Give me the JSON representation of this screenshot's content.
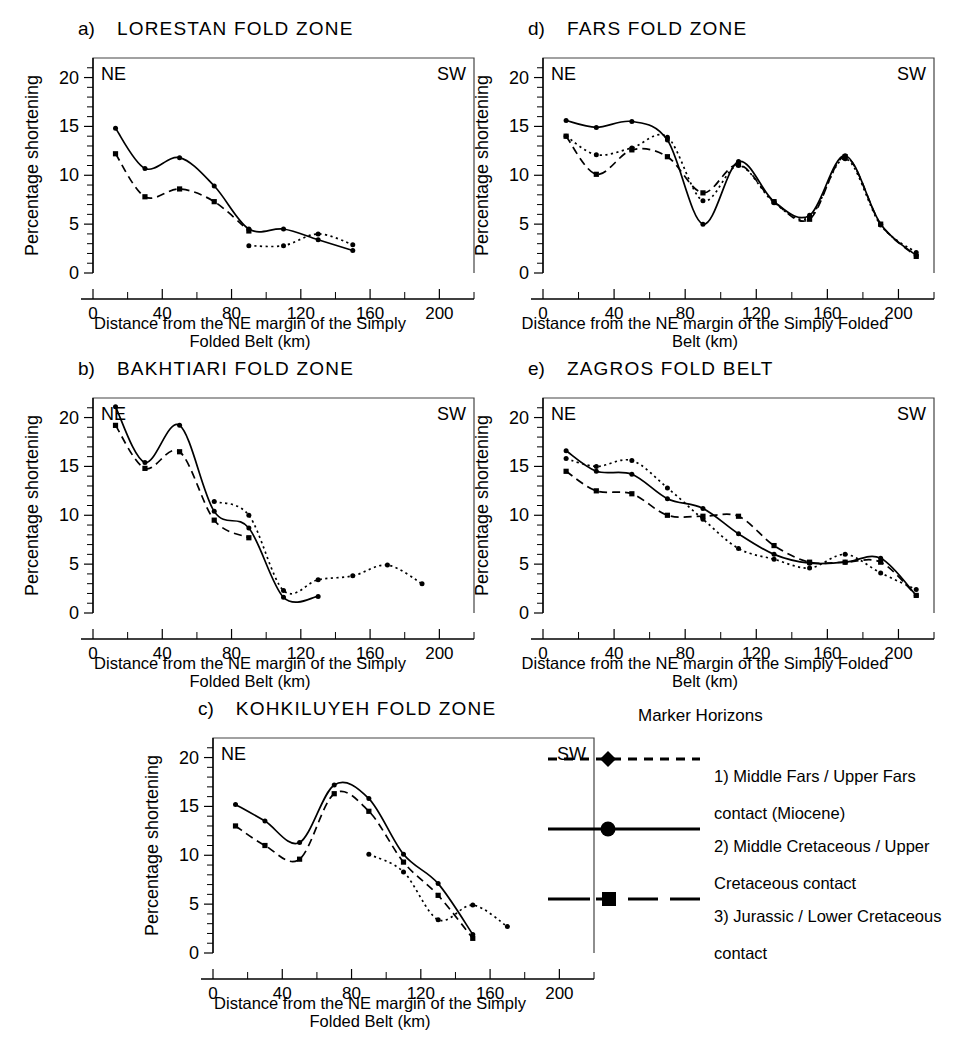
{
  "figure": {
    "axis_y_label": "Percentage shortening",
    "axis_x_label": "Distance from the NE margin of the Simply Folded Belt (km)",
    "axis_x_label_line1": "Distance from the NE margin of the Simply",
    "axis_x_label_line2": "Folded Belt (km)",
    "axis_x_label_wide_line1": "Distance from the NE margin of the Simply Folded",
    "axis_x_label_wide_line2": "Belt (km)",
    "corner_left": "NE",
    "corner_right": "SW",
    "yticks": [
      "0",
      "5",
      "10",
      "15",
      "20"
    ],
    "xticks": [
      "0",
      "40",
      "80",
      "120",
      "160",
      "200"
    ]
  },
  "legend": {
    "title": "Marker Horizons",
    "items": [
      {
        "style": "dotted-diamond",
        "line1": "1) Middle Fars / Upper Fars",
        "line2": "contact (Miocene)"
      },
      {
        "style": "solid-circle",
        "line1": "2) Middle Cretaceous / Upper",
        "line2": "Cretaceous contact"
      },
      {
        "style": "dashed-square",
        "line1": "3) Jurassic / Lower Cretaceous",
        "line2": "contact"
      }
    ]
  },
  "chart_data": [
    {
      "id": "a",
      "type": "line",
      "letter": "a)",
      "title": "LORESTAN  FOLD  ZONE",
      "xlabel": "Distance from the NE margin of the Simply Folded Belt (km)",
      "ylabel": "Percentage shortening",
      "xlim": [
        0,
        220
      ],
      "ylim": [
        0,
        22
      ],
      "grid": false,
      "series": [
        {
          "name": "1) Middle Fars / Upper Fars contact (Miocene)",
          "style": "dotted",
          "x": [
            90,
            110,
            130,
            150
          ],
          "y": [
            2.8,
            2.8,
            4.0,
            2.9
          ]
        },
        {
          "name": "2) Middle Cretaceous / Upper Cretaceous contact",
          "style": "solid",
          "x": [
            13,
            30,
            50,
            70,
            90,
            110,
            130,
            150
          ],
          "y": [
            14.8,
            10.7,
            11.8,
            8.9,
            4.5,
            4.5,
            3.4,
            2.3
          ]
        },
        {
          "name": "3) Jurassic / Lower Cretaceous contact",
          "style": "dashed",
          "x": [
            13,
            30,
            50,
            70,
            90
          ],
          "y": [
            12.2,
            7.8,
            8.6,
            7.3,
            4.3
          ]
        }
      ]
    },
    {
      "id": "b",
      "type": "line",
      "letter": "b)",
      "title": "BAKHTIARI  FOLD  ZONE",
      "xlabel": "Distance from the NE margin of the Simply Folded Belt (km)",
      "ylabel": "Percentage shortening",
      "xlim": [
        0,
        220
      ],
      "ylim": [
        0,
        22
      ],
      "grid": false,
      "series": [
        {
          "name": "1) Middle Fars / Upper Fars contact (Miocene)",
          "style": "dotted",
          "x": [
            70,
            90,
            110,
            130,
            150,
            170,
            190
          ],
          "y": [
            11.4,
            10.0,
            2.3,
            3.4,
            3.8,
            4.9,
            3.0
          ]
        },
        {
          "name": "2) Middle Cretaceous / Upper Cretaceous contact",
          "style": "solid",
          "x": [
            13,
            30,
            50,
            70,
            90,
            110,
            130
          ],
          "y": [
            21.1,
            15.4,
            19.2,
            10.4,
            8.7,
            1.6,
            1.7
          ]
        },
        {
          "name": "3) Jurassic / Lower Cretaceous contact",
          "style": "dashed",
          "x": [
            13,
            30,
            50,
            70,
            90
          ],
          "y": [
            19.2,
            14.8,
            16.5,
            9.5,
            7.7
          ]
        }
      ]
    },
    {
      "id": "c",
      "type": "line",
      "letter": "c)",
      "title": "KOHKILUYEH  FOLD  ZONE",
      "xlabel": "Distance from the NE margin of the Simply Folded Belt (km)",
      "ylabel": "Percentage shortening",
      "xlim": [
        0,
        220
      ],
      "ylim": [
        0,
        22
      ],
      "grid": false,
      "series": [
        {
          "name": "1) Middle Fars / Upper Fars contact (Miocene)",
          "style": "dotted",
          "x": [
            90,
            110,
            130,
            150,
            170
          ],
          "y": [
            10.1,
            8.3,
            3.4,
            4.9,
            2.7
          ]
        },
        {
          "name": "2) Middle Cretaceous / Upper Cretaceous contact",
          "style": "solid",
          "x": [
            13,
            30,
            50,
            70,
            90,
            110,
            130,
            150
          ],
          "y": [
            15.2,
            13.5,
            11.3,
            17.2,
            15.8,
            10.1,
            7.1,
            1.9
          ]
        },
        {
          "name": "3) Jurassic / Lower Cretaceous contact",
          "style": "dashed",
          "x": [
            13,
            30,
            50,
            70,
            90,
            110,
            130,
            150
          ],
          "y": [
            13.0,
            11.0,
            9.6,
            16.3,
            14.5,
            9.3,
            5.9,
            1.5
          ]
        }
      ]
    },
    {
      "id": "d",
      "type": "line",
      "letter": "d)",
      "title": "FARS  FOLD  ZONE",
      "xlabel": "Distance from the NE margin of the Simply Folded Belt (km)",
      "ylabel": "Percentage shortening",
      "xlim": [
        0,
        220
      ],
      "ylim": [
        0,
        22
      ],
      "grid": false,
      "series": [
        {
          "name": "1) Middle Fars / Upper Fars contact (Miocene)",
          "style": "dotted",
          "x": [
            13,
            30,
            50,
            70,
            90,
            110,
            130,
            150,
            170,
            190,
            210
          ],
          "y": [
            14.0,
            12.1,
            12.8,
            13.9,
            7.4,
            11.0,
            7.2,
            5.7,
            11.7,
            4.9,
            2.1
          ]
        },
        {
          "name": "2) Middle Cretaceous / Upper Cretaceous contact",
          "style": "solid",
          "x": [
            13,
            30,
            50,
            70,
            90,
            110,
            130,
            150,
            170,
            190,
            210
          ],
          "y": [
            15.6,
            14.9,
            15.5,
            13.6,
            5.0,
            11.4,
            7.3,
            5.9,
            12.0,
            5.0,
            1.8
          ]
        },
        {
          "name": "3) Jurassic / Lower Cretaceous contact",
          "style": "dashed",
          "x": [
            13,
            30,
            50,
            70,
            90,
            110,
            130,
            150,
            170,
            190,
            210
          ],
          "y": [
            14.0,
            10.1,
            12.6,
            11.9,
            8.2,
            11.1,
            7.3,
            5.5,
            11.9,
            5.0,
            1.7
          ]
        }
      ]
    },
    {
      "id": "e",
      "type": "line",
      "letter": "e)",
      "title": "ZAGROS FOLD BELT",
      "xlabel": "Distance from the NE margin of the Simply Folded Belt (km)",
      "ylabel": "Percentage shortening",
      "xlim": [
        0,
        220
      ],
      "ylim": [
        0,
        22
      ],
      "grid": false,
      "series": [
        {
          "name": "1) Middle Fars / Upper Fars contact (Miocene)",
          "style": "dotted",
          "x": [
            13,
            30,
            50,
            70,
            90,
            110,
            130,
            150,
            170,
            190,
            210
          ],
          "y": [
            15.8,
            15.0,
            15.6,
            12.8,
            9.6,
            6.6,
            5.5,
            4.6,
            6.0,
            4.1,
            2.4
          ]
        },
        {
          "name": "2) Middle Cretaceous / Upper Cretaceous contact",
          "style": "solid",
          "x": [
            13,
            30,
            50,
            70,
            90,
            110,
            130,
            150,
            170,
            190,
            210
          ],
          "y": [
            16.6,
            14.5,
            14.2,
            11.7,
            10.7,
            8.1,
            6.0,
            5.1,
            5.2,
            5.6,
            1.8
          ]
        },
        {
          "name": "3) Jurassic / Lower Cretaceous contact",
          "style": "dashed",
          "x": [
            13,
            30,
            50,
            70,
            90,
            110,
            130,
            150,
            170,
            190,
            210
          ],
          "y": [
            14.5,
            12.5,
            12.2,
            10.0,
            9.9,
            9.9,
            6.9,
            5.2,
            5.2,
            5.2,
            1.8
          ]
        }
      ]
    }
  ]
}
